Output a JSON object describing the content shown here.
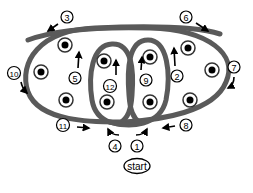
{
  "diagram": {
    "type": "path-sequence",
    "start_label": "start",
    "colors": {
      "loop_stroke": "#6e6e6e",
      "loop_stroke_dark": "#3c3c3c",
      "dot_fill": "#000000",
      "label_stroke": "#000000",
      "background": "#ffffff"
    },
    "dots": [
      {
        "id": "dot-1",
        "x": 65,
        "y": 45
      },
      {
        "id": "dot-2",
        "x": 41,
        "y": 72
      },
      {
        "id": "dot-3",
        "x": 66,
        "y": 100
      },
      {
        "id": "dot-4",
        "x": 104,
        "y": 61
      },
      {
        "id": "dot-5",
        "x": 107,
        "y": 102
      },
      {
        "id": "dot-6",
        "x": 150,
        "y": 57
      },
      {
        "id": "dot-7",
        "x": 150,
        "y": 102
      },
      {
        "id": "dot-8",
        "x": 188,
        "y": 48
      },
      {
        "id": "dot-9",
        "x": 212,
        "y": 70
      },
      {
        "id": "dot-10",
        "x": 190,
        "y": 100
      }
    ],
    "steps": [
      {
        "number": "1",
        "x": 137,
        "y": 146
      },
      {
        "number": "2",
        "x": 177,
        "y": 76
      },
      {
        "number": "3",
        "x": 67,
        "y": 17
      },
      {
        "number": "4",
        "x": 115,
        "y": 146
      },
      {
        "number": "5",
        "x": 75,
        "y": 78
      },
      {
        "number": "6",
        "x": 186,
        "y": 17
      },
      {
        "number": "7",
        "x": 234,
        "y": 67
      },
      {
        "number": "8",
        "x": 186,
        "y": 125
      },
      {
        "number": "9",
        "x": 146,
        "y": 80
      },
      {
        "number": "10",
        "x": 14,
        "y": 73
      },
      {
        "number": "11",
        "x": 63,
        "y": 125
      },
      {
        "number": "12",
        "x": 110,
        "y": 86
      }
    ]
  }
}
